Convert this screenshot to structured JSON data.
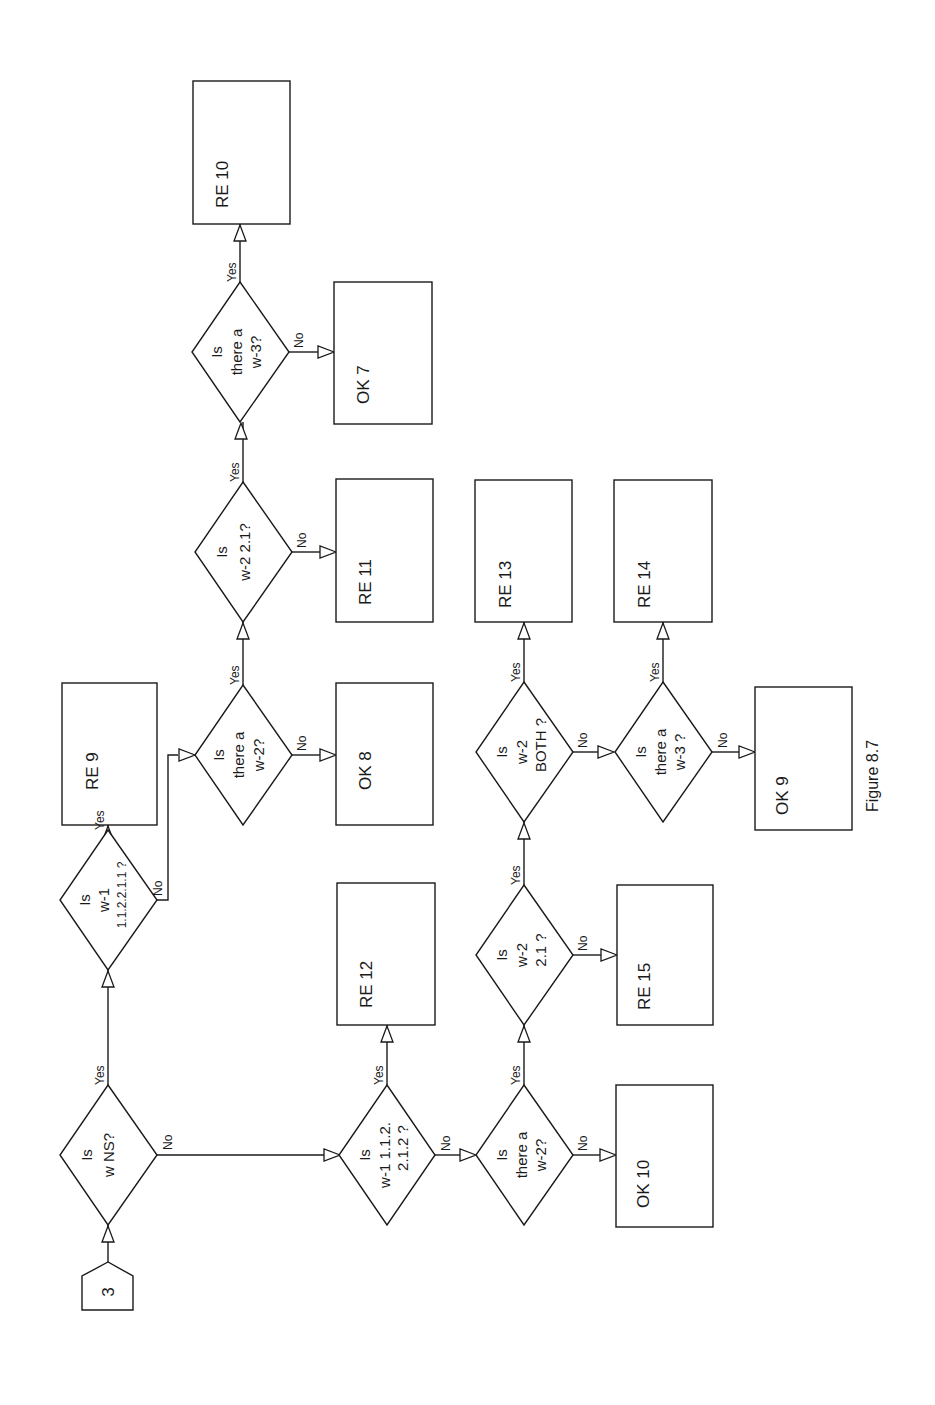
{
  "figure": {
    "caption": "Figure 8.7",
    "orientation": "rotated 90° counter-clockwise"
  },
  "start": {
    "label": "3"
  },
  "edges": {
    "yes": "Yes",
    "no": "No"
  },
  "decisions": {
    "d_ns": {
      "line1": "Is",
      "line2": "w  NS?",
      "line3": ""
    },
    "d_w1_1": {
      "line1": "Is",
      "line2": "w-1",
      "line3": "1.1.2.2.1.1 ?"
    },
    "d_w2_top": {
      "line1": "Is",
      "line2": "there a",
      "line3": "w-2?"
    },
    "d_w2_21_top": {
      "line1": "Is",
      "line2": "w-2  2.1?",
      "line3": ""
    },
    "d_w3_top": {
      "line1": "Is",
      "line2": "there a",
      "line3": "w-3?"
    },
    "d_w1_2": {
      "line1": "Is",
      "line2": "w-1  1.1.2.",
      "line3": "2.1.2 ?"
    },
    "d_w2_bot": {
      "line1": "Is",
      "line2": "there a",
      "line3": "w-2?"
    },
    "d_w2_21_bot": {
      "line1": "Is",
      "line2": "w-2",
      "line3": "2.1 ?"
    },
    "d_both": {
      "line1": "Is",
      "line2": "w-2",
      "line3": "BOTH ?"
    },
    "d_w3_bot": {
      "line1": "Is",
      "line2": "there a",
      "line3": "w-3 ?"
    }
  },
  "outcomes": {
    "re9": "RE 9",
    "ok8": "OK 8",
    "re11": "RE 11",
    "ok7": "OK 7",
    "re10": "RE 10",
    "re12": "RE 12",
    "ok10": "OK 10",
    "re15": "RE 15",
    "re13": "RE 13",
    "re14": "RE 14",
    "ok9": "OK 9"
  }
}
